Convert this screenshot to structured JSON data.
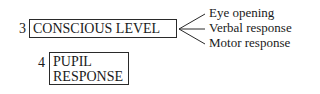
{
  "items": [
    {
      "number": "3",
      "label": "CONSCIOUS LEVEL"
    },
    {
      "number": "4",
      "label_line1": "PUPIL",
      "label_line2": "RESPONSE"
    }
  ],
  "branches": [
    "Eye opening",
    "Verbal response",
    "Motor response"
  ]
}
